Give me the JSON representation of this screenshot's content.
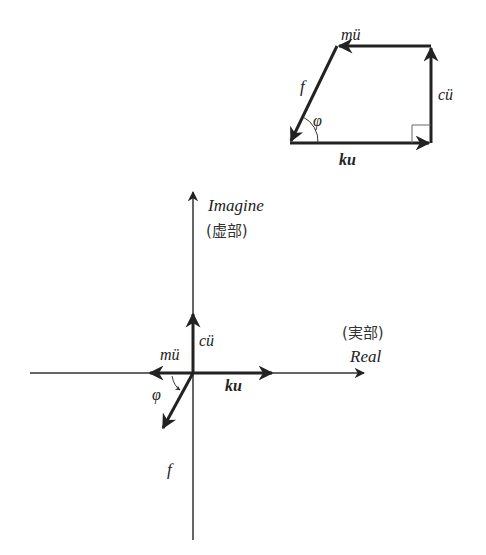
{
  "polygon": {
    "labels": {
      "f": "f",
      "phi": "φ",
      "ku": "ku",
      "cu": "cü",
      "mu": "mü"
    }
  },
  "axes": {
    "imag_label": "Imagine",
    "imag_label_cjk": "(虚部)",
    "real_label": "Real",
    "real_label_cjk": "(実部)"
  },
  "phasors": {
    "labels": {
      "f": "f",
      "phi": "φ",
      "ku": "ku",
      "cu": "cü",
      "mu": "mü"
    }
  },
  "colors": {
    "stroke": "#222222",
    "thin": "#555555"
  }
}
